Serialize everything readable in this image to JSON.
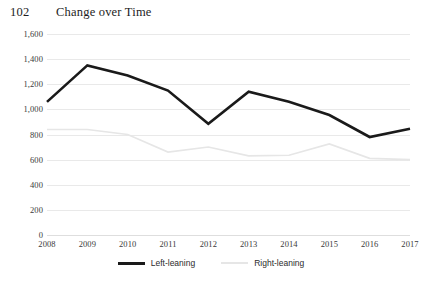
{
  "header": {
    "page_number": "102",
    "title": "Change over Time"
  },
  "legend": {
    "position": "bottom-center",
    "items": [
      {
        "label": "Left-leaning",
        "color": "#1a1a1a"
      },
      {
        "label": "Right-leaning",
        "color": "#e6e6e6"
      }
    ]
  },
  "chart_data": {
    "type": "line",
    "title": "Change over Time",
    "xlabel": "",
    "ylabel": "",
    "categories": [
      "2008",
      "2009",
      "2010",
      "2011",
      "2012",
      "2013",
      "2014",
      "2015",
      "2016",
      "2017"
    ],
    "ylim": [
      0,
      1600
    ],
    "ytick_step": 200,
    "yticks": [
      "0",
      "200",
      "400",
      "600",
      "800",
      "1,000",
      "1,200",
      "1,400",
      "1,600"
    ],
    "grid": true,
    "legend_position": "bottom-center",
    "series": [
      {
        "name": "Left-leaning",
        "color": "#1a1a1a",
        "width": 2.6,
        "values": [
          1060,
          1350,
          1270,
          1150,
          885,
          1140,
          1060,
          955,
          780,
          845
        ]
      },
      {
        "name": "Right-leaning",
        "color": "#e6e6e6",
        "width": 1.6,
        "values": [
          840,
          840,
          800,
          660,
          700,
          630,
          635,
          725,
          610,
          600
        ]
      }
    ]
  }
}
